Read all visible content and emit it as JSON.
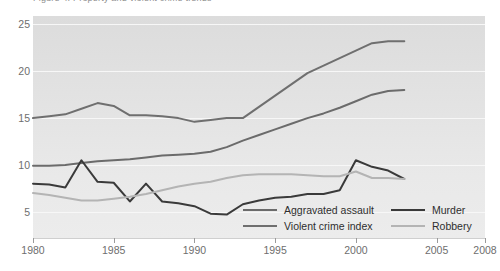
{
  "title_clipped": "Figure 4. Property and violent crime trends",
  "axes": {
    "y_ticks": [
      5,
      10,
      15,
      20,
      25
    ],
    "x_ticks": [
      1980,
      1985,
      1990,
      1995,
      2000,
      2005,
      2008
    ],
    "xlim": [
      1980,
      2008
    ],
    "ylim": [
      2.2,
      25.9
    ]
  },
  "legend": [
    {
      "label": "Aggravated assault",
      "color": "#6b6b6b"
    },
    {
      "label": "Violent crime index",
      "color": "#6f6f6f"
    },
    {
      "label": "Murder",
      "color": "#3a3a3a"
    },
    {
      "label": "Robbery",
      "color": "#b4b4b4"
    }
  ],
  "colors": {
    "panel": "#e6e6e6",
    "grid": "#f7f7f7",
    "axis_text": "#6e6e6e",
    "legend_text": "#2e2e2e"
  },
  "chart_data": {
    "type": "line",
    "title": "Figure 4. Property and violent crime trends",
    "xlabel": "",
    "ylabel": "",
    "xlim": [
      1980,
      2008
    ],
    "ylim": [
      2.2,
      25.9
    ],
    "grid": true,
    "legend_position": "bottom-center",
    "x": [
      1980,
      1981,
      1982,
      1983,
      1984,
      1985,
      1986,
      1987,
      1988,
      1989,
      1990,
      1991,
      1992,
      1993,
      1994,
      1995,
      1996,
      1997,
      1998,
      1999,
      2000,
      2001,
      2002,
      2003
    ],
    "series": [
      {
        "name": "Violent crime index",
        "color": "#6f6f6f",
        "values": [
          15.0,
          15.2,
          15.4,
          16.0,
          16.6,
          16.3,
          15.3,
          15.3,
          15.2,
          15.0,
          14.6,
          14.8,
          15.0,
          15.0,
          16.2,
          17.4,
          18.6,
          19.8,
          20.6,
          21.4,
          22.2,
          23.0,
          23.2,
          23.2
        ]
      },
      {
        "name": "Aggravated assault",
        "color": "#6b6b6b",
        "values": [
          9.9,
          9.9,
          10.0,
          10.2,
          10.4,
          10.5,
          10.6,
          10.8,
          11.0,
          11.1,
          11.2,
          11.4,
          11.9,
          12.6,
          13.2,
          13.8,
          14.4,
          15.0,
          15.5,
          16.1,
          16.8,
          17.5,
          17.9,
          18.0
        ]
      },
      {
        "name": "Murder",
        "color": "#3a3a3a",
        "values": [
          8.0,
          7.9,
          7.6,
          10.5,
          8.2,
          8.1,
          6.1,
          8.0,
          6.1,
          5.9,
          5.6,
          4.8,
          4.7,
          5.8,
          6.2,
          6.5,
          6.6,
          6.9,
          6.9,
          7.3,
          10.5,
          9.8,
          9.4,
          8.5
        ]
      },
      {
        "name": "Robbery",
        "color": "#b4b4b4",
        "values": [
          7.0,
          6.8,
          6.5,
          6.2,
          6.2,
          6.4,
          6.6,
          6.9,
          7.3,
          7.7,
          8.0,
          8.2,
          8.6,
          8.9,
          9.0,
          9.0,
          9.0,
          8.9,
          8.8,
          8.8,
          9.3,
          8.6,
          8.6,
          8.5
        ]
      }
    ]
  }
}
